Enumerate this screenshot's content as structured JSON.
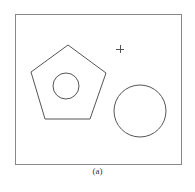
{
  "caption": "(a)",
  "colors": {
    "stroke": "#555555",
    "frame": "#888888",
    "background": "#ffffff"
  },
  "figure": {
    "frame": {
      "x": 15,
      "y": 14,
      "width": 166,
      "height": 150
    },
    "pentagon": {
      "points": [
        [
          68,
          45
        ],
        [
          106,
          73
        ],
        [
          90,
          119
        ],
        [
          45,
          119
        ],
        [
          31,
          72
        ]
      ]
    },
    "inner_circle": {
      "cx": 66,
      "cy": 86,
      "r": 13
    },
    "large_circle": {
      "cx": 140,
      "cy": 111,
      "r": 26
    },
    "crosshair": {
      "cx": 120,
      "cy": 49,
      "arm": 4
    }
  }
}
